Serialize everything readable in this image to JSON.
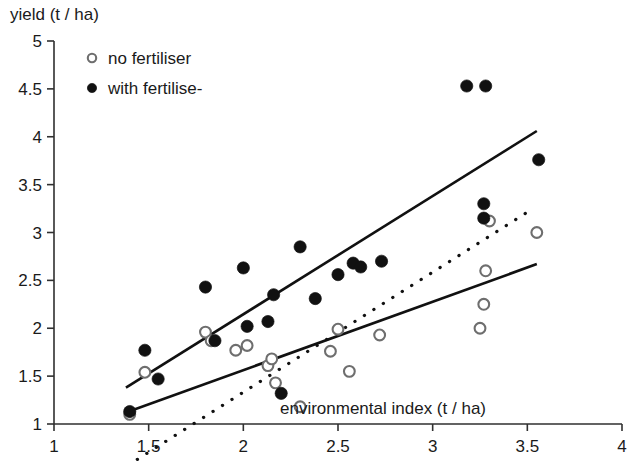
{
  "chart_data": {
    "type": "scatter",
    "title": "",
    "ylabel": "yield (t / ha)",
    "xlabel": "environmental index (t / ha)",
    "xlim": [
      1,
      4
    ],
    "ylim": [
      1,
      5
    ],
    "xticks": [
      "1",
      "1.5",
      "2",
      "2.5",
      "3",
      "3.5",
      "4"
    ],
    "xtick_values": [
      1,
      1.5,
      2,
      2.5,
      3,
      3.5,
      4
    ],
    "yticks": [
      "1",
      "1.5",
      "2",
      "2.5",
      "3",
      "3.5",
      "4",
      "4.5",
      "5"
    ],
    "ytick_values": [
      1,
      1.5,
      2,
      2.5,
      3,
      3.5,
      4,
      4.5,
      5
    ],
    "grid": false,
    "legend_position": "top-left",
    "series": [
      {
        "name": "no fertiliser",
        "marker": "open-circle",
        "color": "#6e6e6e",
        "points": [
          [
            1.4,
            1.1
          ],
          [
            1.48,
            1.54
          ],
          [
            1.8,
            1.96
          ],
          [
            1.83,
            1.87
          ],
          [
            1.96,
            1.77
          ],
          [
            2.02,
            1.82
          ],
          [
            2.13,
            1.61
          ],
          [
            2.15,
            1.68
          ],
          [
            2.17,
            1.43
          ],
          [
            2.3,
            1.18
          ],
          [
            2.46,
            1.76
          ],
          [
            2.5,
            1.99
          ],
          [
            2.56,
            1.55
          ],
          [
            2.72,
            1.93
          ],
          [
            3.25,
            2.0
          ],
          [
            3.27,
            2.25
          ],
          [
            3.28,
            2.6
          ],
          [
            3.3,
            3.12
          ],
          [
            3.55,
            3.0
          ]
        ]
      },
      {
        "name": "with fertiliser",
        "marker": "filled-circle",
        "color": "#111111",
        "points": [
          [
            1.4,
            1.13
          ],
          [
            1.48,
            1.77
          ],
          [
            1.55,
            1.47
          ],
          [
            1.8,
            2.43
          ],
          [
            1.85,
            1.87
          ],
          [
            2.0,
            2.63
          ],
          [
            2.02,
            2.02
          ],
          [
            2.13,
            2.07
          ],
          [
            2.16,
            2.35
          ],
          [
            2.2,
            1.32
          ],
          [
            2.3,
            2.85
          ],
          [
            2.38,
            2.31
          ],
          [
            2.5,
            2.56
          ],
          [
            2.58,
            2.68
          ],
          [
            2.62,
            2.64
          ],
          [
            2.73,
            2.7
          ],
          [
            3.18,
            4.53
          ],
          [
            3.28,
            4.53
          ],
          [
            3.27,
            3.3
          ],
          [
            3.27,
            3.15
          ],
          [
            3.56,
            3.76
          ]
        ]
      }
    ],
    "fits": [
      {
        "name": "with fertiliser regression",
        "style": "solid",
        "x0": 1.38,
        "y0": 1.38,
        "x1": 3.55,
        "y1": 4.06
      },
      {
        "name": "no fertiliser regression",
        "style": "solid",
        "x0": 1.38,
        "y0": 1.12,
        "x1": 3.55,
        "y1": 2.67
      },
      {
        "name": "dotted trend",
        "style": "dotted",
        "x0": 1.44,
        "y0": 0.63,
        "x1": 3.53,
        "y1": 3.25
      }
    ]
  },
  "legend": {
    "entries": [
      {
        "label": "no fertiliser",
        "marker": "open-circle"
      },
      {
        "label": "with fertilise-",
        "marker": "filled-circle"
      }
    ]
  }
}
